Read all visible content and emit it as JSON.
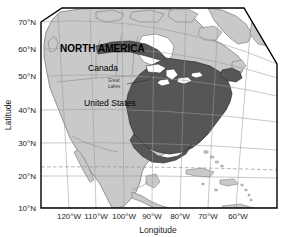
{
  "figure": {
    "type": "map",
    "projection": "conic",
    "title": "",
    "region": "North America"
  },
  "axes": {
    "x": {
      "title": "Longitude",
      "ticks": [
        "120°W",
        "110°W",
        "100°W",
        "90°W",
        "80°W",
        "70°W",
        "60°W"
      ],
      "values": [
        -120,
        -110,
        -100,
        -90,
        -80,
        -70,
        -60
      ]
    },
    "y": {
      "title": "Latitude",
      "ticks": [
        "70°N",
        "60°N",
        "50°N",
        "40°N",
        "30°N",
        "20°N",
        "10°N"
      ],
      "values": [
        70,
        60,
        50,
        40,
        30,
        20,
        10
      ]
    }
  },
  "map_labels": {
    "continent": "NORTH AMERICA",
    "country_canada": "Canada",
    "country_usa": "United States",
    "feature_great_lakes_line1": "Great",
    "feature_great_lakes_line2": "Lakes"
  },
  "colors": {
    "ocean": "#ffffff",
    "land": "#c9c9c9",
    "land_outline": "#6e6e6e",
    "range_shading": "#565656",
    "range_outline": "#2b2b2b",
    "lakes": "#ffffff",
    "graticule": "#9a9a9a",
    "tropic_line": "#8f8f8f",
    "frame": "#000000",
    "text": "#111111"
  },
  "annotations": {
    "tropic_of_cancer_dashed": true,
    "great_lakes_leader_line": true
  }
}
